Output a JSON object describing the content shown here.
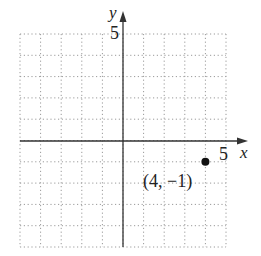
{
  "chart_data": {
    "type": "scatter",
    "title": "",
    "xlabel": "x",
    "ylabel": "y",
    "xlim": [
      -5,
      5
    ],
    "ylim": [
      -5,
      5
    ],
    "grid": true,
    "grid_style": "dotted",
    "x_tick_labels": [
      "5"
    ],
    "y_tick_labels": [
      "5"
    ],
    "points": [
      {
        "x": 4,
        "y": -1,
        "label": "(4, −1)"
      }
    ],
    "annotations": [
      "(4, −1)"
    ]
  },
  "labels": {
    "x_axis": "x",
    "y_axis": "y",
    "x_tick": "5",
    "y_tick": "5",
    "point": "(4, −1)"
  },
  "colors": {
    "axis": "#333333",
    "grid": "#999999",
    "point": "#111111"
  }
}
